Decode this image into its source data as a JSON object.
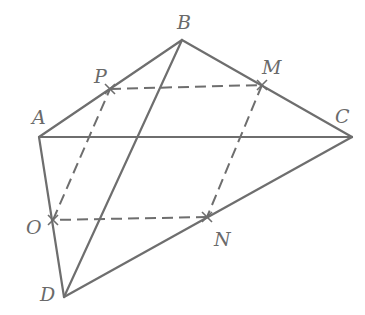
{
  "diagram": {
    "colors": {
      "line": "#6e6e6e",
      "label": "#6a6a6a",
      "background": "#ffffff"
    },
    "points": {
      "A": {
        "label": "A",
        "x": 39,
        "y": 137,
        "lx": 32,
        "ly": 124
      },
      "B": {
        "label": "B",
        "x": 182,
        "y": 40,
        "lx": 177,
        "ly": 29
      },
      "C": {
        "label": "C",
        "x": 352,
        "y": 137,
        "lx": 335,
        "ly": 123
      },
      "D": {
        "label": "D",
        "x": 64,
        "y": 297,
        "lx": 40,
        "ly": 301
      },
      "P": {
        "label": "P",
        "x": 110,
        "y": 89,
        "lx": 94,
        "ly": 83
      },
      "M": {
        "label": "M",
        "x": 262,
        "y": 85,
        "lx": 262,
        "ly": 74
      },
      "N": {
        "label": "N",
        "x": 207,
        "y": 217,
        "lx": 214,
        "ly": 246
      },
      "O": {
        "label": "O",
        "x": 53,
        "y": 220,
        "lx": 26,
        "ly": 234
      }
    },
    "solid_edges": [
      [
        "A",
        "B"
      ],
      [
        "B",
        "C"
      ],
      [
        "A",
        "C"
      ],
      [
        "A",
        "D"
      ],
      [
        "B",
        "D"
      ],
      [
        "C",
        "D"
      ]
    ],
    "dashed_edges": [
      [
        "P",
        "M"
      ],
      [
        "M",
        "N"
      ],
      [
        "N",
        "O"
      ],
      [
        "O",
        "P"
      ]
    ],
    "marked_points": [
      "P",
      "M",
      "N",
      "O"
    ]
  }
}
